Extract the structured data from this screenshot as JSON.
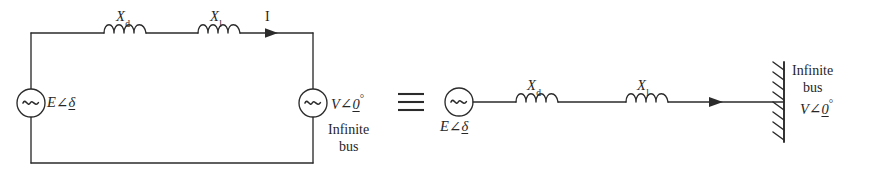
{
  "figure": {
    "equivalence_symbol": "≡"
  },
  "left_circuit": {
    "name": "closed-loop circuit",
    "source_generator": {
      "symbol": "~",
      "label_var": "E",
      "label_angle": "∠",
      "label_phase": "δ"
    },
    "source_infinite_bus": {
      "symbol": "~",
      "label_var": "V",
      "label_angle": "∠",
      "label_phase": "0",
      "label_degree": "°",
      "caption_line1": "Infinite",
      "caption_line2": "bus"
    },
    "reactance_1": {
      "var": "X",
      "subscript": "d"
    },
    "reactance_2": {
      "var": "X",
      "subscript": "l"
    },
    "current_label": "I"
  },
  "right_circuit": {
    "name": "single-line equivalent",
    "source_generator": {
      "symbol": "~",
      "label_var": "E",
      "label_angle": "∠",
      "label_phase": "δ"
    },
    "reactance_1": {
      "var": "X",
      "subscript": "d"
    },
    "reactance_2": {
      "var": "X",
      "subscript": "l"
    },
    "infinite_bus": {
      "caption_line1": "Infinite",
      "caption_line2": "bus",
      "label_var": "V",
      "label_angle": "∠",
      "label_phase": "0",
      "label_degree": "°"
    }
  },
  "colors": {
    "ink": "#2b2b2b",
    "background": "#ffffff"
  }
}
